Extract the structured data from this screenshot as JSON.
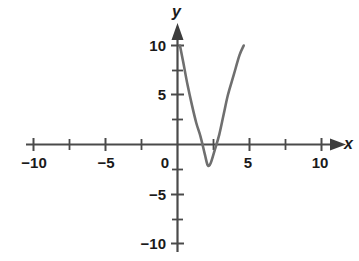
{
  "chart_data": {
    "type": "line",
    "title": "",
    "subtitle": "",
    "xlabel": "x",
    "ylabel": "y",
    "xlim": [
      -11,
      11
    ],
    "ylim": [
      -11,
      11
    ],
    "grid": false,
    "legend": null,
    "x_ticks_labeled": [
      -10,
      -5,
      0,
      5,
      10
    ],
    "x_tick_labels": [
      "−10",
      "−5",
      "0",
      "5",
      "10"
    ],
    "x_ticks_minor": [
      -7.5,
      -2.5,
      2.5,
      7.5
    ],
    "y_ticks_labeled": [
      10,
      5,
      -5,
      -10
    ],
    "y_tick_labels": [
      "10",
      "5",
      "−5",
      "−10"
    ],
    "y_ticks_minor": [
      7.5,
      2.5,
      -2.5,
      -7.5
    ],
    "axis_arrows": [
      "x-positive",
      "y-positive"
    ],
    "curve_color": "#6f6f6f",
    "axis_color": "#4a4a4a",
    "text_color": "#1a1a1a",
    "series": [
      {
        "name": "parabola",
        "equation": "y = 2.4(x - 2.1)^2 - 2.1",
        "vertex": [
          2.1,
          -2.1
        ],
        "x_intercepts": [
          1.16,
          3.04
        ],
        "y_intercept": 8.5,
        "x_domain": [
          0.17,
          4.6
        ],
        "points": [
          [
            0.17,
            10.0
          ],
          [
            0.4,
            8.3
          ],
          [
            0.7,
            6.0
          ],
          [
            1.0,
            4.0
          ],
          [
            1.3,
            2.2
          ],
          [
            1.6,
            0.8
          ],
          [
            1.9,
            -1.0
          ],
          [
            2.1,
            -2.1
          ],
          [
            2.3,
            -1.9
          ],
          [
            2.6,
            -0.5
          ],
          [
            2.9,
            1.0
          ],
          [
            3.2,
            3.0
          ],
          [
            3.5,
            5.0
          ],
          [
            3.9,
            7.0
          ],
          [
            4.3,
            9.0
          ],
          [
            4.6,
            10.0
          ]
        ]
      }
    ]
  },
  "axes": {
    "x_label": "x",
    "y_label": "y"
  },
  "x_tick_labels": [
    {
      "text": "−10",
      "value": -10
    },
    {
      "text": "−5",
      "value": -5
    },
    {
      "text": "0",
      "value": 0
    },
    {
      "text": "5",
      "value": 5
    },
    {
      "text": "10",
      "value": 10
    }
  ],
  "y_tick_labels": [
    {
      "text": "10",
      "value": 10
    },
    {
      "text": "5",
      "value": 5
    },
    {
      "text": "−5",
      "value": -5
    },
    {
      "text": "−10",
      "value": -10
    }
  ]
}
